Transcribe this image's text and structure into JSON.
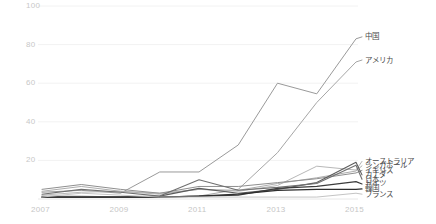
{
  "chart_data": {
    "type": "line",
    "title": "",
    "subtitle": "",
    "xlabel": "",
    "ylabel": "",
    "x": [
      2007,
      2008,
      2009,
      2010,
      2011,
      2012,
      2013,
      2014,
      2015
    ],
    "xlim": [
      2007,
      2015
    ],
    "ylim": [
      0,
      100
    ],
    "xticks": [
      "2007",
      "2009",
      "2011",
      "2013",
      "2015"
    ],
    "xtick_values": [
      2007,
      2009,
      2011,
      2013,
      2015
    ],
    "yticks": [
      "20",
      "40",
      "60",
      "80",
      "100"
    ],
    "ytick_values": [
      20,
      40,
      60,
      80,
      100
    ],
    "grid": true,
    "grid_color": "#f2f2f2",
    "legend_position": "right-inline-labels",
    "series": [
      {
        "name": "中国",
        "color": "#9a9a9a",
        "width": 1.0,
        "label_y_value": 84,
        "values": [
          3.5,
          4.5,
          3.0,
          14.0,
          14.0,
          28.0,
          60.0,
          54.5,
          83.0
        ]
      },
      {
        "name": "アメリカ",
        "color": "#a6a6a6",
        "width": 1.0,
        "label_y_value": 72,
        "values": [
          1.5,
          1.5,
          1.0,
          1.0,
          1.5,
          5.0,
          24.0,
          50.0,
          71.0
        ]
      },
      {
        "name": "オーストラリア",
        "color": "#b8b8b8",
        "width": 1.0,
        "label_y_value": 19.5,
        "values": [
          2.0,
          3.5,
          4.0,
          3.0,
          5.0,
          4.0,
          7.0,
          17.0,
          15.0
        ]
      },
      {
        "name": "シンガポール",
        "color": "#aeaeae",
        "width": 1.0,
        "label_y_value": 17.2,
        "values": [
          4.0,
          6.5,
          4.0,
          2.5,
          5.0,
          4.5,
          8.0,
          11.0,
          14.5
        ]
      },
      {
        "name": "イギリス",
        "color": "#8f8f8f",
        "width": 1.0,
        "label_y_value": 14.8,
        "values": [
          5.0,
          7.5,
          5.0,
          3.0,
          6.5,
          6.5,
          8.5,
          10.5,
          13.5
        ]
      },
      {
        "name": "カナダ",
        "color": "#5c5c5c",
        "width": 1.1,
        "label_y_value": 12.5,
        "values": [
          1.0,
          1.0,
          1.0,
          1.5,
          5.5,
          3.0,
          5.0,
          8.5,
          19.0
        ]
      },
      {
        "name": "日本",
        "color": "#707070",
        "width": 1.1,
        "label_y_value": 10.2,
        "values": [
          2.5,
          5.0,
          3.5,
          1.5,
          10.0,
          4.5,
          6.0,
          8.0,
          17.5
        ]
      },
      {
        "name": "ドイツ",
        "color": "#3c3c3c",
        "width": 1.2,
        "label_y_value": 7.8,
        "values": [
          1.0,
          1.0,
          1.0,
          1.0,
          1.5,
          2.0,
          5.5,
          6.5,
          9.0
        ]
      },
      {
        "name": "韓国",
        "color": "#2e2e2e",
        "width": 1.2,
        "label_y_value": 5.2,
        "values": [
          1.0,
          1.0,
          1.0,
          1.0,
          1.5,
          2.5,
          4.5,
          5.0,
          5.0
        ]
      },
      {
        "name": "フランス",
        "color": "#c4c4c4",
        "width": 1.0,
        "label_y_value": 2.5,
        "values": [
          1.0,
          3.0,
          2.0,
          1.0,
          1.0,
          1.0,
          1.0,
          1.0,
          3.0
        ]
      }
    ]
  },
  "axes": {
    "y_labels": [
      "100",
      "80",
      "60",
      "40",
      "20"
    ],
    "x_labels": [
      "2007",
      "2009",
      "2011",
      "2013",
      "2015"
    ]
  }
}
